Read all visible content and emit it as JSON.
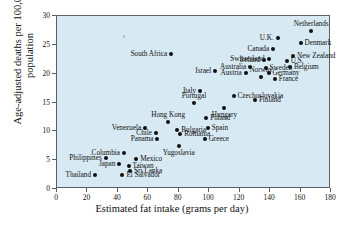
{
  "chart_data": {
    "type": "scatter",
    "title": "",
    "xlabel": "Estimated fat intake (grams per day)",
    "ylabel": "Age-adjusted deaths per 100,000 population",
    "xlim": [
      0,
      180
    ],
    "ylim": [
      0,
      30
    ],
    "xticks": [
      0,
      20,
      40,
      60,
      80,
      100,
      120,
      140,
      160,
      180
    ],
    "yticks": [
      0,
      5,
      10,
      15,
      20,
      25,
      30
    ],
    "grid": false,
    "legend": "none",
    "points": [
      {
        "label": "South Africa",
        "x": 75,
        "y": 23.4,
        "labelpos": "r"
      },
      {
        "label": "Israel",
        "x": 104,
        "y": 20.4,
        "labelpos": "r"
      },
      {
        "label": "Netherlands",
        "x": 167,
        "y": 27.4,
        "labelpos": "t"
      },
      {
        "label": "Denmark",
        "x": 160,
        "y": 25.3,
        "labelpos": "l"
      },
      {
        "label": "U.K.",
        "x": 145,
        "y": 26.2,
        "labelpos": "r"
      },
      {
        "label": "Canada",
        "x": 142,
        "y": 24.3,
        "labelpos": "r"
      },
      {
        "label": "U.S.",
        "x": 151,
        "y": 22.2,
        "labelpos": "l"
      },
      {
        "label": "New Zealand",
        "x": 155,
        "y": 23.0,
        "labelpos": "l"
      },
      {
        "label": "Switzerland",
        "x": 139,
        "y": 22.6,
        "labelpos": "r"
      },
      {
        "label": "Ireland",
        "x": 136,
        "y": 22.3,
        "labelpos": "r"
      },
      {
        "label": "Sweden",
        "x": 137,
        "y": 21.0,
        "labelpos": "l"
      },
      {
        "label": "Belgium",
        "x": 153,
        "y": 21.2,
        "labelpos": "l"
      },
      {
        "label": "Australia",
        "x": 127,
        "y": 21.1,
        "labelpos": "r"
      },
      {
        "label": "Germany",
        "x": 139,
        "y": 20.2,
        "labelpos": "l"
      },
      {
        "label": "Austria",
        "x": 124,
        "y": 20.1,
        "labelpos": "r"
      },
      {
        "label": "Norway",
        "x": 134,
        "y": 19.5,
        "labelpos": "t"
      },
      {
        "label": "France",
        "x": 143,
        "y": 19.1,
        "labelpos": "l"
      },
      {
        "label": "Italy",
        "x": 94,
        "y": 17.0,
        "labelpos": "r"
      },
      {
        "label": "Czechoslovakia",
        "x": 116,
        "y": 16.2,
        "labelpos": "l"
      },
      {
        "label": "Finland",
        "x": 130,
        "y": 15.4,
        "labelpos": "l"
      },
      {
        "label": "Portugal",
        "x": 90,
        "y": 15.0,
        "labelpos": "t"
      },
      {
        "label": "Hungary",
        "x": 110,
        "y": 14.0,
        "labelpos": "b"
      },
      {
        "label": "Hong Kong",
        "x": 73,
        "y": 11.6,
        "labelpos": "t"
      },
      {
        "label": "Poland",
        "x": 98,
        "y": 12.3,
        "labelpos": "l"
      },
      {
        "label": "Venezuela",
        "x": 58,
        "y": 10.6,
        "labelpos": "r"
      },
      {
        "label": "Bulgaria",
        "x": 79,
        "y": 10.3,
        "labelpos": "l"
      },
      {
        "label": "Spain",
        "x": 99,
        "y": 10.6,
        "labelpos": "l"
      },
      {
        "label": "Chile",
        "x": 65,
        "y": 9.7,
        "labelpos": "r"
      },
      {
        "label": "Romania",
        "x": 81,
        "y": 9.5,
        "labelpos": "l"
      },
      {
        "label": "Panama",
        "x": 66,
        "y": 8.6,
        "labelpos": "r"
      },
      {
        "label": "Greece",
        "x": 97,
        "y": 8.6,
        "labelpos": "l"
      },
      {
        "label": "Yugoslavia",
        "x": 80,
        "y": 7.4,
        "labelpos": "b"
      },
      {
        "label": "Columbia",
        "x": 44,
        "y": 6.3,
        "labelpos": "r"
      },
      {
        "label": "Philippines",
        "x": 32,
        "y": 5.3,
        "labelpos": "r"
      },
      {
        "label": "Mexico",
        "x": 52,
        "y": 5.2,
        "labelpos": "l"
      },
      {
        "label": "Japan",
        "x": 41,
        "y": 4.4,
        "labelpos": "r"
      },
      {
        "label": "Taiwan",
        "x": 47,
        "y": 4.0,
        "labelpos": "l"
      },
      {
        "label": "Sri Lanka",
        "x": 48,
        "y": 3.2,
        "labelpos": "l"
      },
      {
        "label": "Thailand",
        "x": 25,
        "y": 2.5,
        "labelpos": "r"
      },
      {
        "label": "El Salvador",
        "x": 43,
        "y": 2.4,
        "labelpos": "l"
      }
    ]
  },
  "colors": {
    "plot_background": "#d7e8f1",
    "point": "#111111",
    "axis": "#5a5f66",
    "text": "#111111",
    "page_background": "#ffffff"
  }
}
